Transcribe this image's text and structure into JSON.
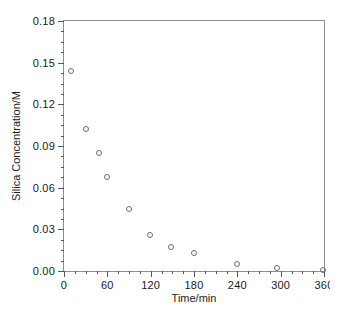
{
  "chart_data": {
    "type": "scatter",
    "title": "",
    "xlabel": "Time/min",
    "ylabel": "Silica Concentration/M",
    "xlim": [
      0,
      360
    ],
    "ylim": [
      0.0,
      0.18
    ],
    "grid": false,
    "legend": null,
    "xticks": [
      0,
      60,
      120,
      180,
      240,
      300,
      360
    ],
    "xticklabels": [
      "0",
      "60",
      "120",
      "180",
      "240",
      "300",
      "360"
    ],
    "yticks": [
      0.0,
      0.03,
      0.06,
      0.09,
      0.12,
      0.15,
      0.18
    ],
    "yticklabels": [
      "0.00",
      "0.03",
      "0.06",
      "0.09",
      "0.12",
      "0.15",
      "0.18"
    ],
    "x_minor_tick_interval": 15,
    "y_minor_tick_interval": 0.0075,
    "marker": "open-circle",
    "marker_color": "#6e6e6e",
    "frame_color": "#8c8c8c",
    "x": [
      10,
      31,
      48,
      60,
      90,
      119,
      148,
      180,
      239,
      295,
      359
    ],
    "y": [
      0.144,
      0.102,
      0.085,
      0.068,
      0.045,
      0.026,
      0.017,
      0.013,
      0.005,
      0.002,
      0.001
    ],
    "points": [
      {
        "x": 10,
        "y": 0.144
      },
      {
        "x": 31,
        "y": 0.102
      },
      {
        "x": 48,
        "y": 0.085
      },
      {
        "x": 60,
        "y": 0.068
      },
      {
        "x": 90,
        "y": 0.045
      },
      {
        "x": 119,
        "y": 0.026
      },
      {
        "x": 148,
        "y": 0.017
      },
      {
        "x": 180,
        "y": 0.013
      },
      {
        "x": 239,
        "y": 0.005
      },
      {
        "x": 295,
        "y": 0.002
      },
      {
        "x": 359,
        "y": 0.001
      }
    ]
  }
}
